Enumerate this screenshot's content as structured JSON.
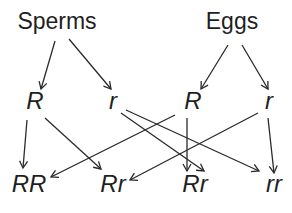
{
  "diagram": {
    "parents": [
      {
        "label": "Sperms",
        "alleles": [
          "R",
          "r"
        ]
      },
      {
        "label": "Eggs",
        "alleles": [
          "R",
          "r"
        ]
      }
    ],
    "offspring": [
      "RR",
      "Rr",
      "Rr",
      "rr"
    ],
    "edges": [
      {
        "from": "Sperms",
        "to": "R (sperm)"
      },
      {
        "from": "Sperms",
        "to": "r (sperm)"
      },
      {
        "from": "Eggs",
        "to": "R (egg)"
      },
      {
        "from": "Eggs",
        "to": "r (egg)"
      },
      {
        "from": "R (sperm)",
        "to": "RR"
      },
      {
        "from": "R (sperm)",
        "to": "Rr (1)"
      },
      {
        "from": "r (sperm)",
        "to": "Rr (2)"
      },
      {
        "from": "r (sperm)",
        "to": "rr"
      },
      {
        "from": "R (egg)",
        "to": "RR"
      },
      {
        "from": "R (egg)",
        "to": "Rr (2)"
      },
      {
        "from": "r (egg)",
        "to": "Rr (1)"
      },
      {
        "from": "r (egg)",
        "to": "rr"
      }
    ],
    "line_color": "#2a2a2a",
    "text_color": "#1f1f1f"
  }
}
